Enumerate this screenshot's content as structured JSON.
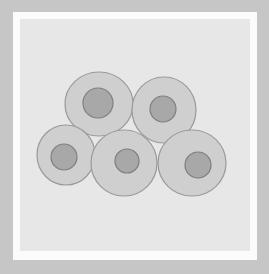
{
  "figure": {
    "colors": {
      "outer_border": "#c6c6c6",
      "mat": "#fbfbfb",
      "background": "#e7e7e7",
      "cytoplasm_fill": "#cfcfcf",
      "cell_outline": "#9a9a9a",
      "nucleus_fill": "#a8a8a8",
      "nucleus_outline": "#7e7e7e"
    },
    "cells": [
      {
        "name": "cell-top-left",
        "cx": 99,
        "cy": 104,
        "rx": 34,
        "ry": 32,
        "nx": 98,
        "ny": 103,
        "nr": 15
      },
      {
        "name": "cell-top-right",
        "cx": 164,
        "cy": 110,
        "rx": 32,
        "ry": 33,
        "nx": 163,
        "ny": 109,
        "nr": 13
      },
      {
        "name": "cell-bottom-left",
        "cx": 66,
        "cy": 155,
        "rx": 29,
        "ry": 30,
        "nx": 64,
        "ny": 157,
        "nr": 13
      },
      {
        "name": "cell-bottom-middle",
        "cx": 124,
        "cy": 163,
        "rx": 33,
        "ry": 33,
        "nx": 127,
        "ny": 161,
        "nr": 12
      },
      {
        "name": "cell-bottom-right",
        "cx": 192,
        "cy": 163,
        "rx": 34,
        "ry": 33,
        "nx": 198,
        "ny": 165,
        "nr": 13
      }
    ]
  }
}
